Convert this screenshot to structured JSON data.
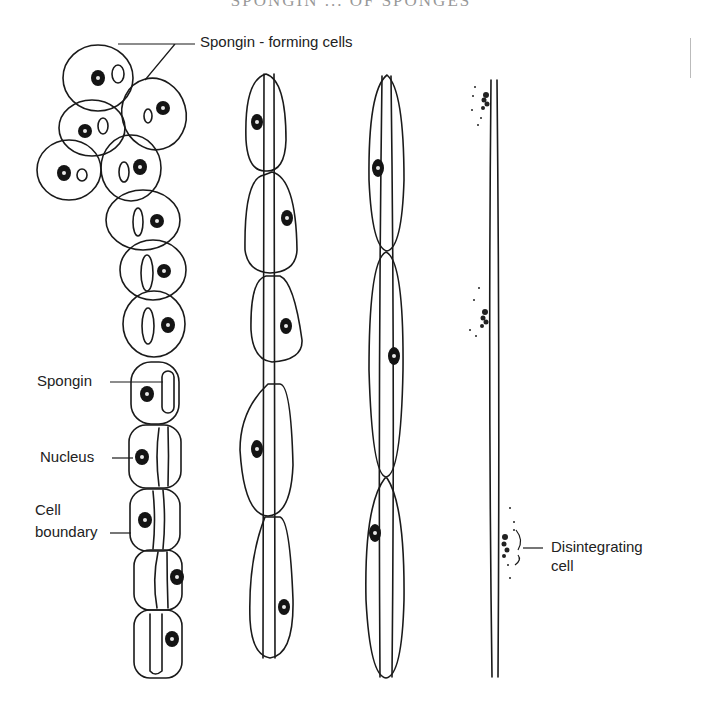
{
  "figure": {
    "header_title_cropped": "SPONGIN ... OF SPONGES",
    "labels": {
      "spongin_forming_cells": "Spongin - forming cells",
      "spongin": "Spongin",
      "nucleus": "Nucleus",
      "cell_boundary_line1": "Cell",
      "cell_boundary_line2": "boundary",
      "disintegrating_line1": "Disintegrating",
      "disintegrating_line2": "cell"
    },
    "stages": [
      {
        "id": "stage-1",
        "description": "Cluster of rounded spongin-forming cells, each with nucleus and small spongin granule, forming a chain downward"
      },
      {
        "id": "stage-2",
        "description": "Chain of elongated cells with spongin fiber running through center"
      },
      {
        "id": "stage-3",
        "description": "Three long spindle-shaped cells around a continuous spongin fiber"
      },
      {
        "id": "stage-4",
        "description": "Finished spongin fiber with disintegrating cells alongside"
      }
    ]
  }
}
